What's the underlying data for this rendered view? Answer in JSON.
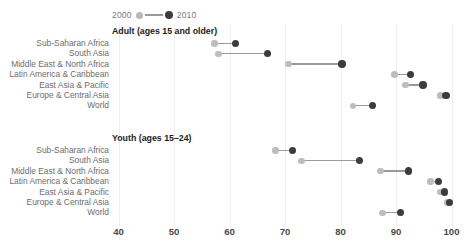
{
  "legend": {
    "old_label": "2000",
    "new_label": "2010",
    "old_color": "#bdbdbd",
    "new_color": "#3c3c3c",
    "connector_color": "#9a9a9a"
  },
  "axis": {
    "ticks": [
      "40",
      "50",
      "60",
      "70",
      "80",
      "90",
      "100"
    ],
    "min": 40,
    "max": 100
  },
  "chart_data": [
    {
      "type": "scatter",
      "title": "Adult (ages 15 and older)",
      "xlabel": "",
      "ylabel": "",
      "xlim": [
        40,
        100
      ],
      "grid": true,
      "legend_position": "top",
      "categories": [
        "Sub-Saharan Africa",
        "South Asia",
        "Middle East & North Africa",
        "Latin America & Caribbean",
        "East Asia & Pacific",
        "Europe & Central Asia",
        "World"
      ],
      "series": [
        {
          "name": "2000",
          "values": [
            57.3,
            58.0,
            70.6,
            89.7,
            91.7,
            98.0,
            82.3
          ]
        },
        {
          "name": "2010",
          "values": [
            61.1,
            66.8,
            80.3,
            92.6,
            94.9,
            99.0,
            85.8
          ]
        }
      ]
    },
    {
      "type": "scatter",
      "title": "Youth (ages 15–24)",
      "xlabel": "",
      "ylabel": "",
      "xlim": [
        40,
        100
      ],
      "grid": true,
      "legend_position": "top",
      "categories": [
        "Sub-Saharan Africa",
        "South Asia",
        "Middle East & North Africa",
        "Latin America & Caribbean",
        "East Asia & Pacific",
        "Europe & Central Asia",
        "World"
      ],
      "series": [
        {
          "name": "2000",
          "values": [
            68.3,
            73.0,
            87.2,
            96.2,
            98.0,
            99.2,
            87.6
          ]
        },
        {
          "name": "2010",
          "values": [
            71.3,
            83.4,
            92.2,
            97.7,
            98.7,
            99.6,
            90.8
          ]
        }
      ]
    }
  ]
}
